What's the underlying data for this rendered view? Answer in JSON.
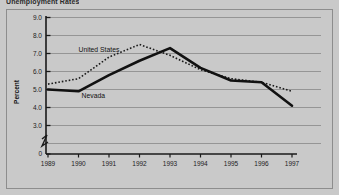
{
  "figure": {
    "title": "Unemployment Rates",
    "frame_border_color": "#8d8d8d",
    "background_color": "#c9c9c9"
  },
  "chart_data": {
    "type": "line",
    "title": "Unemployment Rates",
    "xlabel": "",
    "ylabel": "Percent",
    "x": [
      1989,
      1990,
      1991,
      1992,
      1993,
      1994,
      1995,
      1996,
      1997
    ],
    "categories": [
      "1989",
      "1990",
      "1991",
      "1992",
      "1993",
      "1994",
      "1995",
      "1996",
      "1997"
    ],
    "ylim": [
      3.0,
      9.0
    ],
    "yticks": [
      "9.0",
      "8.0",
      "7.0",
      "6.0",
      "5.0",
      "4.0",
      "3.0",
      "0"
    ],
    "ytick_values": [
      9.0,
      8.0,
      7.0,
      6.0,
      5.0,
      4.0,
      3.0,
      0
    ],
    "axis_break": true,
    "grid": true,
    "grid_axis": "y",
    "legend": "inline-labels",
    "series": [
      {
        "name": "United States",
        "style": "dotted",
        "color": "#1a1a1a",
        "values": [
          5.3,
          5.6,
          6.8,
          7.5,
          6.9,
          6.1,
          5.6,
          5.4,
          4.9
        ],
        "label_x": 1990.0,
        "label_y": 7.1
      },
      {
        "name": "Nevada",
        "style": "solid",
        "color": "#111111",
        "values": [
          5.0,
          4.9,
          5.8,
          6.6,
          7.3,
          6.2,
          5.5,
          5.4,
          4.1
        ],
        "label_x": 1990.1,
        "label_y": 4.55
      }
    ]
  }
}
